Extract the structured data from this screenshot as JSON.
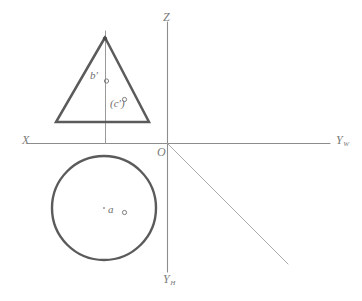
{
  "drawing": {
    "title": "Two-view orthographic projection: cone front view and circle top view with point markers",
    "width": 362,
    "height": 301,
    "background_color": "#ffffff"
  },
  "colors": {
    "axis": "#8d8d8d",
    "object_outline": "#5b5b5b",
    "centerline": "#9a9a9a",
    "bisector": "#a8a8a8",
    "label_text": "#7a7a7a",
    "point_marker": "#6e6e6e"
  },
  "axes": {
    "origin": {
      "label": "O",
      "x": 167,
      "y": 143
    },
    "x_axis": {
      "label": "X",
      "x1": 28,
      "y1": 143,
      "x2": 330,
      "y2": 143
    },
    "z_axis": {
      "label": "Z",
      "x1": 167,
      "y1": 22,
      "x2": 167,
      "y2": 143
    },
    "y_w_axis": {
      "label": "Y",
      "subscript": "W",
      "x1": 167,
      "y1": 143,
      "x2": 330,
      "y2": 143
    },
    "y_h_axis": {
      "label": "Y",
      "subscript": "H",
      "x1": 167,
      "y1": 143,
      "x2": 167,
      "y2": 272
    },
    "bisector_45": {
      "x1": 167,
      "y1": 143,
      "x2": 288,
      "y2": 264
    }
  },
  "front_view": {
    "name": "triangle-cone-front-view",
    "apex": {
      "x": 105,
      "y": 37
    },
    "base_left": {
      "x": 56,
      "y": 122
    },
    "base_right": {
      "x": 149,
      "y": 122
    },
    "centerline": {
      "x": 105,
      "y1": 31,
      "y2": 143
    }
  },
  "top_view": {
    "name": "circle-cone-top-view",
    "center": {
      "x": 104,
      "y": 208
    },
    "radius": 52,
    "center_dot": {
      "x": 104,
      "y": 208
    }
  },
  "point_labels": [
    {
      "id": "b-prime",
      "text": "b′",
      "marker": "circle",
      "x": 90,
      "y": 70
    },
    {
      "id": "c-prime",
      "text": "(c′)",
      "marker": "circle",
      "x": 110,
      "y": 98
    },
    {
      "id": "a",
      "text": "a",
      "marker": "circle",
      "x": 108,
      "y": 204
    }
  ],
  "markers": {
    "b_prime_dot": {
      "x": 106,
      "y": 81,
      "r": 2.1
    },
    "c_prime_dot": {
      "x": 124,
      "y": 99,
      "r": 2.1
    },
    "a_dot": {
      "x": 124,
      "y": 212,
      "r": 2.1
    },
    "apex_dot": {
      "x": 105,
      "y": 38,
      "r": 2.0
    },
    "circle_center_dot": {
      "x": 104,
      "y": 208,
      "r": 0.9
    }
  },
  "labels": {
    "x": "X",
    "z": "Z",
    "o": "O",
    "y_base": "Y",
    "y_w_sub": "W",
    "y_h_sub": "H",
    "b_prime": "b′",
    "c_prime": "(c′)",
    "a": "a"
  }
}
